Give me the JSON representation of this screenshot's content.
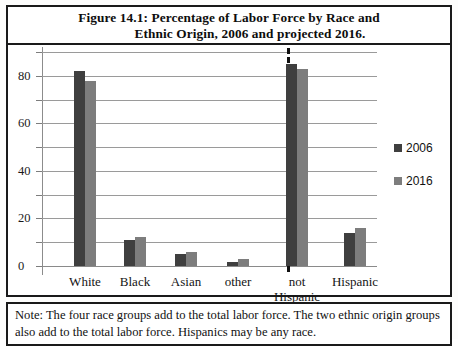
{
  "figure": {
    "title_line_1": "Figure 14.1:  Percentage of Labor Force by Race and",
    "title_line_2": "Ethnic Origin, 2006 and projected 2016.",
    "note": "Note:  The four race groups add to the total labor force. The two ethnic origin groups also add to the total labor force. Hispanics may be any race."
  },
  "legend": {
    "items": [
      {
        "label": "2006",
        "color": "#3f3f3f"
      },
      {
        "label": "2016",
        "color": "#7d7d7d"
      }
    ]
  },
  "axis": {
    "y_tick_labels": [
      "0",
      "20",
      "40",
      "60",
      "80"
    ],
    "y_minor_values": [
      10,
      30,
      50,
      70,
      90
    ]
  },
  "categories": {
    "white": "White",
    "black": "Black",
    "asian": "Asian",
    "other": "other",
    "not_hispanic_1": "not",
    "not_hispanic_2": "Hispanic",
    "hispanic": "Hispanic"
  },
  "chart_data": {
    "type": "bar",
    "title": "Figure 14.1:  Percentage of Labor Force by Race and Ethnic Origin, 2006 and projected 2016.",
    "xlabel": "",
    "ylabel": "",
    "ylim": [
      0,
      90
    ],
    "yticks": [
      0,
      20,
      40,
      60,
      80
    ],
    "yticks_minor": [
      10,
      30,
      50,
      70,
      90
    ],
    "grid": true,
    "legend_position": "right",
    "categories": [
      "White",
      "Black",
      "Asian",
      "other",
      "not Hispanic",
      "Hispanic"
    ],
    "series": [
      {
        "name": "2006",
        "color": "#3f3f3f",
        "values": [
          82,
          11,
          5,
          1.5,
          85,
          14
        ]
      },
      {
        "name": "2016",
        "color": "#7d7d7d",
        "values": [
          78,
          12,
          6,
          3,
          83,
          16
        ]
      }
    ],
    "annotations": [
      {
        "type": "vertical-dashed-divider",
        "after_category": "other",
        "note": "separates race groups from ethnic origin groups"
      }
    ]
  }
}
